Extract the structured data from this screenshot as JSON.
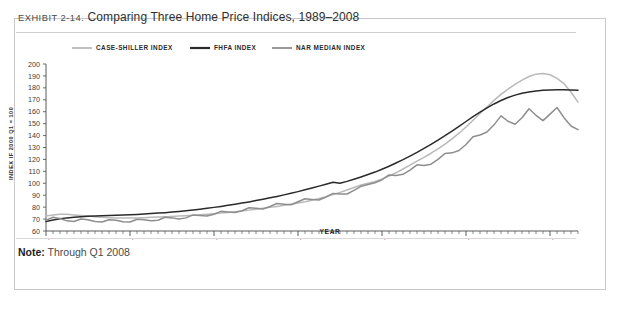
{
  "exhibit": {
    "label": "EXHIBIT 2-14.",
    "title": "Comparing Three Home Price Indices, 1989–2008",
    "note_label": "Note:",
    "note_text": "Through Q1 2008"
  },
  "chart_data": {
    "type": "line",
    "title": "Comparing Three Home Price Indices, 1989–2008",
    "xlabel": "YEAR",
    "ylabel": "INDEX IF 2000 Q1 = 100",
    "ylim": [
      60,
      200
    ],
    "ytick_step": 10,
    "yticks": [
      60,
      70,
      80,
      90,
      100,
      110,
      120,
      130,
      140,
      150,
      160,
      170,
      180,
      190,
      200
    ],
    "grid": false,
    "legend_position": "top-left",
    "x_start_label": "1989 Q1",
    "x_end_label": "2008 Q1",
    "x_major_ticks": [
      "1989 Q1",
      "1992 Q1",
      "1995 Q1",
      "1998 Q1",
      "2001 Q1",
      "2004 Q1",
      "2007 Q1"
    ],
    "x_major_indices": [
      0,
      12,
      24,
      36,
      48,
      60,
      72
    ],
    "n_points": 77,
    "colors": {
      "case_shiller": "#b9b9b9",
      "fhfa": "#2a2a2a",
      "nar": "#8e8e8e",
      "axis": "#5a5a5a"
    },
    "series": [
      {
        "name": "CASE-SHILLER INDEX",
        "color": "#b9b9b9",
        "values": [
          72.5,
          73.5,
          74.0,
          74.0,
          73.5,
          73.0,
          72.5,
          72.0,
          71.5,
          71.2,
          71.0,
          70.8,
          70.8,
          71.0,
          71.2,
          71.5,
          71.8,
          72.0,
          72.2,
          72.5,
          72.8,
          73.2,
          73.6,
          74.0,
          74.5,
          75.0,
          75.6,
          76.2,
          76.8,
          77.5,
          78.2,
          79.0,
          79.8,
          80.6,
          81.5,
          82.4,
          83.4,
          84.5,
          85.8,
          87.2,
          88.8,
          90.5,
          92.4,
          94.4,
          96.5,
          98.5,
          100.0,
          101.5,
          103.5,
          106.0,
          108.8,
          112.0,
          115.2,
          118.5,
          121.8,
          125.2,
          128.8,
          132.8,
          137.2,
          142.0,
          147.2,
          152.8,
          158.5,
          164.0,
          169.5,
          174.5,
          179.0,
          183.0,
          186.5,
          189.5,
          191.5,
          192.0,
          191.0,
          188.0,
          183.5,
          176.5,
          168.0
        ]
      },
      {
        "name": "FHFA INDEX",
        "color": "#2a2a2a",
        "values": [
          68.0,
          69.2,
          70.2,
          71.0,
          71.6,
          72.0,
          72.3,
          72.6,
          72.8,
          73.0,
          73.2,
          73.4,
          73.6,
          73.9,
          74.2,
          74.6,
          75.0,
          75.4,
          75.9,
          76.4,
          77.0,
          77.6,
          78.3,
          79.0,
          79.8,
          80.6,
          81.5,
          82.4,
          83.4,
          84.4,
          85.5,
          86.6,
          87.8,
          89.0,
          90.3,
          91.6,
          93.0,
          94.5,
          96.0,
          97.6,
          99.2,
          100.8,
          100.0,
          101.6,
          103.4,
          105.3,
          107.3,
          109.4,
          111.8,
          114.3,
          117.0,
          119.8,
          122.8,
          125.9,
          129.2,
          132.6,
          136.2,
          139.9,
          143.8,
          147.8,
          151.8,
          155.8,
          159.6,
          163.2,
          166.5,
          169.4,
          171.9,
          173.9,
          175.5,
          176.6,
          177.4,
          177.9,
          178.2,
          178.4,
          178.4,
          178.3,
          178.0
        ]
      },
      {
        "name": "NAR MEDIAN INDEX",
        "color": "#8e8e8e",
        "values": [
          69.0,
          71.5,
          70.5,
          68.5,
          68.0,
          70.0,
          69.5,
          68.0,
          67.5,
          69.5,
          69.0,
          67.8,
          67.5,
          69.8,
          69.5,
          68.5,
          69.0,
          71.5,
          71.0,
          70.0,
          71.0,
          73.5,
          73.0,
          72.5,
          74.0,
          76.5,
          76.0,
          75.5,
          77.0,
          79.5,
          79.0,
          78.5,
          80.5,
          83.0,
          82.5,
          82.0,
          84.5,
          87.0,
          86.5,
          86.0,
          88.5,
          91.5,
          91.0,
          91.0,
          94.0,
          97.5,
          99.0,
          100.5,
          103.0,
          107.0,
          106.5,
          107.5,
          111.0,
          115.5,
          115.0,
          116.0,
          120.0,
          125.0,
          125.5,
          127.5,
          132.5,
          139.0,
          140.5,
          143.0,
          149.0,
          156.5,
          152.0,
          149.5,
          155.0,
          162.5,
          157.0,
          152.5,
          158.0,
          163.5,
          155.0,
          148.0,
          145.0
        ]
      }
    ]
  },
  "legend": [
    {
      "label": "CASE-SHILLER INDEX",
      "color": "#b9b9b9"
    },
    {
      "label": "FHFA INDEX",
      "color": "#2a2a2a"
    },
    {
      "label": "NAR MEDIAN INDEX",
      "color": "#8e8e8e"
    }
  ]
}
